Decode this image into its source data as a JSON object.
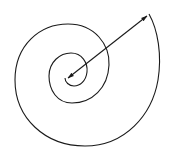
{
  "diagram": {
    "type": "spiral-with-vector",
    "background": "#ffffff",
    "stroke_color": "#1a1a1a",
    "elements": [
      {
        "name": "spiral",
        "kind": "curve",
        "turns": 2.5,
        "direction": "inward-counterclockwise"
      },
      {
        "name": "radius-vector",
        "kind": "arrow",
        "from": [
          68,
          78
        ],
        "to": [
          148,
          16
        ],
        "arrowheads": [
          "start",
          "end"
        ]
      }
    ]
  }
}
